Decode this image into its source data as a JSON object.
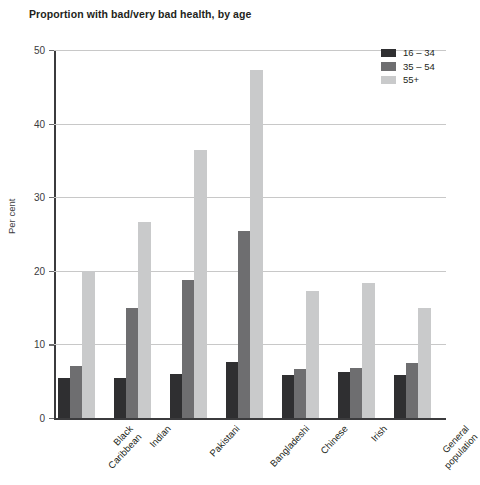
{
  "chart_data": {
    "type": "bar",
    "title": "Proportion with bad/very bad health, by age",
    "xlabel": "",
    "ylabel": "Per cent",
    "ylim": [
      0,
      50
    ],
    "yticks": [
      "0",
      "10",
      "20",
      "30",
      "40",
      "50"
    ],
    "grid": true,
    "legend_position": "top-right",
    "categories": [
      "Black\nCaribbean",
      "Indian",
      "Pakistani",
      "Bangladeshi",
      "Chinese",
      "Irish",
      "General\npopulation"
    ],
    "series": [
      {
        "name": "16 – 34",
        "color": "#2f2f31",
        "values": [
          5.5,
          5.4,
          6.0,
          7.6,
          5.9,
          6.2,
          5.8
        ]
      },
      {
        "name": "35 – 54",
        "color": "#6e6e70",
        "values": [
          7.0,
          14.9,
          18.7,
          25.4,
          6.6,
          6.8,
          7.5
        ]
      },
      {
        "name": "55+",
        "color": "#c9cacb",
        "values": [
          20.0,
          26.6,
          36.4,
          47.3,
          17.2,
          18.4,
          14.9
        ]
      }
    ]
  },
  "axis": {
    "baseline_color": "#3b3b3d",
    "gridline_color": "#c8c8c8"
  }
}
